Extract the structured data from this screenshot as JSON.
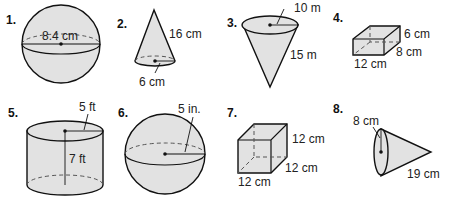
{
  "figures": [
    {
      "number": "1.",
      "shape": "sphere",
      "labels": [
        "8.4 cm"
      ],
      "measure": "diameter"
    },
    {
      "number": "2.",
      "shape": "cone",
      "labels": [
        "16 cm",
        "6 cm"
      ],
      "measure": [
        "slant height",
        "radius"
      ]
    },
    {
      "number": "3.",
      "shape": "inverted cone",
      "labels": [
        "10 m",
        "15 m"
      ],
      "measure": [
        "radius",
        "slant height"
      ]
    },
    {
      "number": "4.",
      "shape": "rectangular prism",
      "labels": [
        "6 cm",
        "8 cm",
        "12 cm"
      ],
      "measure": [
        "height",
        "width",
        "length"
      ]
    },
    {
      "number": "5.",
      "shape": "cylinder",
      "labels": [
        "5 ft",
        "7 ft"
      ],
      "measure": [
        "radius",
        "height"
      ]
    },
    {
      "number": "6.",
      "shape": "sphere",
      "labels": [
        "5 in."
      ],
      "measure": "radius"
    },
    {
      "number": "7.",
      "shape": "cube",
      "labels": [
        "12 cm",
        "12 cm",
        "12 cm"
      ],
      "measure": [
        "height",
        "width",
        "length"
      ]
    },
    {
      "number": "8.",
      "shape": "sideways cone",
      "labels": [
        "8 cm",
        "19 cm"
      ],
      "measure": [
        "radius",
        "slant height"
      ]
    }
  ],
  "colors": {
    "fill": "#e2e2e2",
    "stroke": "#111111",
    "background": "#ffffff"
  }
}
